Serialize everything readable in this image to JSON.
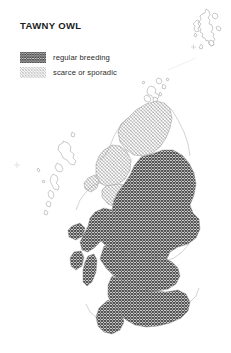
{
  "page": {
    "background": "#ffffff",
    "width": 231,
    "height": 353
  },
  "title": "TAWNY OWL",
  "legend": {
    "items": [
      {
        "label": "regular breeding",
        "swatch": "dense-crosshatch",
        "color": "#555555",
        "density": "dense"
      },
      {
        "label": "scarce or sporadic",
        "swatch": "sparse-crosshatch",
        "color": "#9a9a9a",
        "density": "sparse"
      }
    ]
  },
  "map": {
    "region": "Scotland",
    "projection_note": "British national grid, Shetland shown as inset top right",
    "coastline_color": "#8a8a8a",
    "coastline_width": 0.45,
    "fills": {
      "regular_breeding": "#555555",
      "scarce_or_sporadic": "#9a9a9a",
      "unoccupied": "#ffffff"
    },
    "areas": [
      {
        "name": "shetland-inset",
        "fill": "unoccupied"
      },
      {
        "name": "orkney",
        "fill": "unoccupied"
      },
      {
        "name": "outer-hebrides",
        "fill": "unoccupied"
      },
      {
        "name": "st-kilda-marker",
        "fill": "unoccupied"
      },
      {
        "name": "north-highlands",
        "fill": "scarce_or_sporadic"
      },
      {
        "name": "wester-ross-band",
        "fill": "scarce_or_sporadic"
      },
      {
        "name": "skye",
        "fill": "scarce_or_sporadic"
      },
      {
        "name": "mainland-core",
        "fill": "regular_breeding"
      },
      {
        "name": "argyll-and-islands",
        "fill": "regular_breeding"
      },
      {
        "name": "central-belt",
        "fill": "regular_breeding"
      },
      {
        "name": "southern-uplands-and-borders",
        "fill": "regular_breeding"
      },
      {
        "name": "galloway",
        "fill": "regular_breeding"
      }
    ]
  }
}
